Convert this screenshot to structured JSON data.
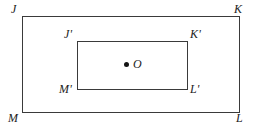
{
  "figure": {
    "type": "geometry-diagram",
    "background_color": "#ffffff",
    "stroke_color": "#3a3a3a",
    "label_color": "#1c1c1c"
  },
  "shapes": {
    "outer_rectangle": {
      "name": "JKLM",
      "vertices": {
        "top_left": "J",
        "top_right": "K",
        "bottom_right": "L",
        "bottom_left": "M"
      }
    },
    "inner_rectangle": {
      "name": "J'K'L'M'",
      "vertices": {
        "top_left": "J'",
        "top_right": "K'",
        "bottom_right": "L'",
        "bottom_left": "M'"
      }
    }
  },
  "center_point": {
    "label": "O",
    "marker": "filled-dot"
  }
}
